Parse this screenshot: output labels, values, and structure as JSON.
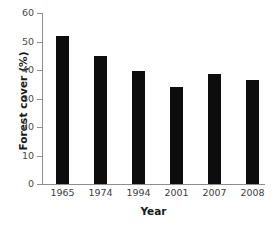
{
  "chart_data": {
    "type": "bar",
    "title": "",
    "xlabel": "Year",
    "ylabel": "Forest cover (%)",
    "categories": [
      "1965",
      "1974",
      "1994",
      "2001",
      "2007",
      "2008"
    ],
    "values": [
      52,
      45,
      39.5,
      34,
      38.5,
      36.5
    ],
    "series": [
      {
        "name": "Forest cover",
        "values": [
          52,
          45,
          39.5,
          34,
          38.5,
          36.5
        ]
      }
    ],
    "ylim": [
      0,
      60
    ],
    "ytick_labels": [
      "0",
      "10",
      "20",
      "30",
      "40",
      "50",
      "60"
    ],
    "ytick_values": [
      0,
      10,
      20,
      30,
      40,
      50,
      60
    ],
    "grid": false,
    "legend": false,
    "bar_color": "#0d0d0d",
    "axis_color": "#8e8e8e",
    "background_color": "#ffffff"
  },
  "axes": {
    "y_title": "Forest cover (%)",
    "x_title": "Year"
  },
  "bars": [
    {
      "label": "1965",
      "value": 52
    },
    {
      "label": "1974",
      "value": 45
    },
    {
      "label": "1994",
      "value": 39.5
    },
    {
      "label": "2001",
      "value": 34
    },
    {
      "label": "2007",
      "value": 38.5
    },
    {
      "label": "2008",
      "value": 36.5
    }
  ],
  "yticks": [
    {
      "label": "60",
      "value": 60
    },
    {
      "label": "50",
      "value": 50
    },
    {
      "label": "40",
      "value": 40
    },
    {
      "label": "30",
      "value": 30
    },
    {
      "label": "20",
      "value": 20
    },
    {
      "label": "10",
      "value": 10
    },
    {
      "label": "0",
      "value": 0
    }
  ]
}
